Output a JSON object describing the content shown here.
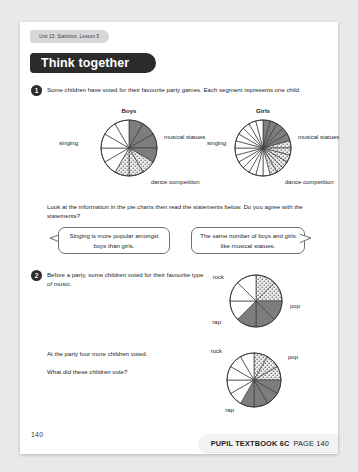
{
  "header": {
    "unit_tab": "Unit 15: Statistics, Lesson 5",
    "banner_title": "Think together"
  },
  "questions": [
    {
      "number": "1",
      "text": "Some children have voted for their favourite party games. Each segment represents one child."
    },
    {
      "number": "2",
      "text": "Before a party, some children voted for their favourite type of music."
    }
  ],
  "prompts": {
    "pie_prompt": "Look at the information in the pie charts then read the statements below. Do you agree with the statements?",
    "party_line1": "At the party four more children voted.",
    "party_line2": "What did these children vote?"
  },
  "bubbles": [
    {
      "text": "Singing is more popular amongst boys than girls.",
      "tail": "left"
    },
    {
      "text": "The same number of boys and girls like musical statues.",
      "tail": "right"
    }
  ],
  "labels": {
    "singing": "singing",
    "musical_statues": "musical statues",
    "dance_competition": "dance competition",
    "rock": "rock",
    "pop": "pop",
    "rap": "rap"
  },
  "footer": {
    "folio": "140",
    "book": "PUPIL TEXTBOOK 6C",
    "page": "PAGE 140"
  },
  "colors": {
    "dark_segment": "#7d7d7d",
    "dotted_segment": "#e8e8e8",
    "white_segment": "#ffffff",
    "outline": "#3d3d3d",
    "banner_bg": "#2b2b2b",
    "page_bg": "#ffffff",
    "canvas_bg": "#e9e9ea"
  },
  "chart_data": [
    {
      "type": "pie",
      "title": "Boys",
      "id": "boys-party-games",
      "total_segments": 12,
      "note": "Each segment represents one child.",
      "categories": [
        "singing",
        "musical statues",
        "dance competition"
      ],
      "values": [
        4,
        3,
        5
      ],
      "styles": [
        "dark",
        "dotted",
        "white"
      ],
      "start_angle_deg": -90,
      "radius": 28
    },
    {
      "type": "pie",
      "title": "Girls",
      "id": "girls-party-games",
      "total_segments": 24,
      "note": "Each segment represents one child.",
      "categories": [
        "singing",
        "musical statues",
        "dance competition"
      ],
      "values": [
        5,
        6,
        13
      ],
      "styles": [
        "dark",
        "dotted",
        "white"
      ],
      "start_angle_deg": -90,
      "radius": 28
    },
    {
      "type": "pie",
      "title": "",
      "id": "music-before-party",
      "total_segments": 8,
      "categories": [
        "rock",
        "pop",
        "rap"
      ],
      "values": [
        2,
        3,
        3
      ],
      "styles": [
        "dotted",
        "dark",
        "white"
      ],
      "start_angle_deg": -90,
      "radius": 26,
      "label_positions": {
        "rock": "left",
        "pop": "right",
        "rap": "bottom-left"
      }
    },
    {
      "type": "pie",
      "title": "",
      "id": "music-at-party",
      "total_segments": 12,
      "categories": [
        "rock",
        "pop",
        "rap"
      ],
      "values": [
        3,
        4,
        5
      ],
      "styles": [
        "dotted",
        "dark",
        "white"
      ],
      "start_angle_deg": -90,
      "radius": 27,
      "label_positions": {
        "rock": "top-left",
        "pop": "top-right",
        "rap": "bottom"
      }
    }
  ]
}
